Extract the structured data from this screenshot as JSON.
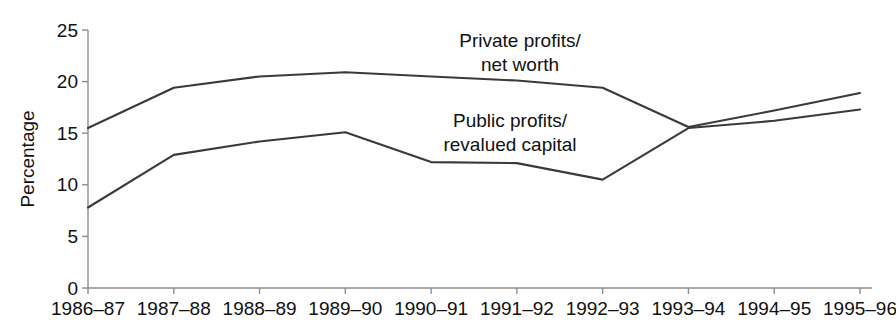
{
  "chart_data": {
    "type": "line",
    "title": "",
    "xlabel": "",
    "ylabel": "Percentage",
    "ylim": [
      0,
      25
    ],
    "yticks": [
      0,
      5,
      10,
      15,
      20,
      25
    ],
    "grid": false,
    "legend_position": "inline-annotations",
    "categories": [
      "1986–87",
      "1987–88",
      "1988–89",
      "1989–90",
      "1990–91",
      "1991–92",
      "1992–93",
      "1993–94",
      "1994–95",
      "1995–96"
    ],
    "series": [
      {
        "name": "Private profits/net worth",
        "values": [
          15.5,
          19.4,
          20.5,
          20.9,
          20.5,
          20.1,
          19.4,
          15.6,
          17.2,
          18.9
        ]
      },
      {
        "name": "Public profits/revalued capital",
        "values": [
          7.8,
          12.9,
          14.2,
          15.1,
          12.2,
          12.1,
          10.5,
          15.5,
          16.2,
          17.3
        ]
      }
    ],
    "annotations": [
      {
        "id": "private-label",
        "lines": [
          "Private profits/",
          "net worth"
        ],
        "x": 520,
        "y": 47
      },
      {
        "id": "public-label",
        "lines": [
          "Public profits/",
          "revalued capital"
        ],
        "x": 510,
        "y": 127
      }
    ],
    "colors": {
      "line": "#3a3a3a",
      "axis": "#8d8d8d",
      "text": "#111111",
      "background": "#ffffff"
    }
  }
}
